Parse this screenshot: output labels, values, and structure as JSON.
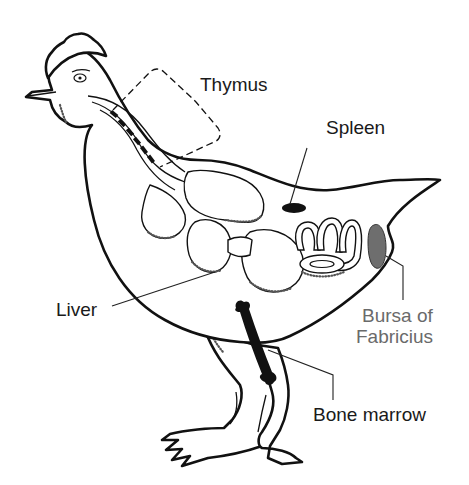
{
  "diagram": {
    "labels": {
      "thymus": "Thymus",
      "spleen": "Spleen",
      "liver": "Liver",
      "bursa_line1": "Bursa of",
      "bursa_line2": "Fabricius",
      "bone_marrow": "Bone marrow"
    },
    "colors": {
      "outline": "#111111",
      "bursa_fill": "#6e6e6e",
      "spleen_fill": "#111111",
      "bone_fill": "#111111",
      "label_text": "#1a1a1a",
      "bursa_label_text": "#6a6a6a",
      "background": "#ffffff"
    }
  }
}
